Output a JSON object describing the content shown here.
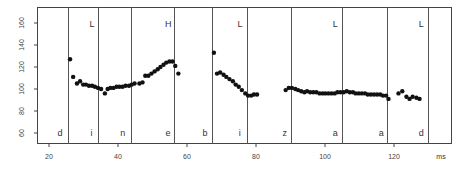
{
  "chart_data": {
    "type": "scatter",
    "title": "",
    "xlabel": "ms",
    "ylabel": "",
    "xlim": [
      16.5,
      136.8
    ],
    "ylim": [
      50,
      172
    ],
    "grid": false,
    "x_ticks": [
      20,
      40,
      60,
      80,
      100,
      120
    ],
    "y_ticks": [
      60,
      80,
      100,
      120,
      140,
      160
    ],
    "segment_boundaries_ms": [
      25.5,
      34.2,
      43.8,
      56.3,
      67.2,
      77.4,
      90.2,
      105,
      118,
      129.9
    ],
    "segments": [
      {
        "label": "d",
        "x_ms": 23.2
      },
      {
        "label": "i",
        "x_ms": 32.3
      },
      {
        "label": "n",
        "x_ms": 41.4
      },
      {
        "label": "e",
        "x_ms": 54.5
      },
      {
        "label": "b",
        "x_ms": 65.2
      },
      {
        "label": "i",
        "x_ms": 75.3
      },
      {
        "label": "z",
        "x_ms": 88.3
      },
      {
        "label": "a",
        "x_ms": 103
      },
      {
        "label": "a",
        "x_ms": 116.3
      },
      {
        "label": "d",
        "x_ms": 127.9
      }
    ],
    "tones": [
      {
        "label": "L",
        "x_ms": 32.5
      },
      {
        "label": "H",
        "x_ms": 54.6
      },
      {
        "label": "L",
        "x_ms": 75.4
      },
      {
        "label": "L",
        "x_ms": 103
      },
      {
        "label": "L",
        "x_ms": 127.9
      }
    ],
    "series": [
      {
        "name": "F0",
        "x": [
          26.1,
          27,
          28.1,
          29,
          29.9,
          30.7,
          31.6,
          32.5,
          33.3,
          34.2,
          35.1,
          36.2,
          37,
          37.8,
          38.7,
          39.6,
          40.4,
          41.3,
          42.2,
          43.2,
          44,
          44.8,
          46.2,
          47.1,
          47.9,
          48.8,
          49.7,
          50.6,
          51.5,
          52.3,
          53.2,
          54,
          54.9,
          55.8,
          56.6,
          57.5,
          67.8,
          68.7,
          69.6,
          70.6,
          71.4,
          72.3,
          73.3,
          74.1,
          75,
          75.9,
          76.9,
          77.7,
          78.6,
          79.4,
          80.3,
          88.6,
          89.5,
          90.4,
          91.4,
          92.2,
          93.1,
          94,
          94.8,
          95.7,
          96.6,
          97.5,
          98.4,
          99.3,
          100.1,
          101,
          101.9,
          102.8,
          103.6,
          104.5,
          105.4,
          106.3,
          107.2,
          108.1,
          108.9,
          109.8,
          110.7,
          111.6,
          112.4,
          113.3,
          114.2,
          115.1,
          116,
          116.8,
          117.7,
          118.4,
          121.3,
          122.4,
          123.6,
          124.5,
          125.4,
          126.5,
          127.4
        ],
        "y": [
          127,
          111,
          105,
          107,
          104,
          104,
          103,
          103,
          102,
          101,
          100,
          96,
          100,
          101,
          101,
          102,
          102,
          102,
          103,
          103,
          104,
          105,
          105,
          106,
          112,
          112,
          114,
          116,
          118,
          120,
          122,
          124,
          125,
          125,
          121,
          114,
          133,
          114,
          115,
          113,
          111,
          109,
          107,
          104,
          102,
          99,
          96,
          94,
          94,
          95,
          95,
          99,
          101,
          101,
          100,
          99,
          98,
          97,
          98,
          97,
          97,
          97,
          96,
          96,
          96,
          96,
          96,
          96,
          97,
          97,
          97,
          98,
          97,
          97,
          96,
          96,
          96,
          96,
          95,
          95,
          95,
          95,
          95,
          94,
          94,
          91,
          96,
          98,
          93,
          91,
          93,
          92,
          91
        ]
      }
    ]
  }
}
